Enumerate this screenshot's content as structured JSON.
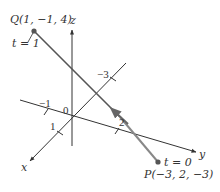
{
  "diagram": {
    "type": "3d-line-segment",
    "axes": {
      "x_label": "x",
      "y_label": "y",
      "z_label": "z",
      "origin_label": "0"
    },
    "ticks": {
      "x_pos": "1",
      "x_neg": "−3",
      "y_neg": "−1",
      "y_pos": "2"
    },
    "points": {
      "Q": {
        "label": "Q(1, −1, 4)",
        "param": "t = 1",
        "coords": [
          1,
          -1,
          4
        ]
      },
      "P": {
        "label": "P(−3, 2, −3)",
        "param": "t = 0",
        "coords": [
          -3,
          2,
          -3
        ]
      }
    },
    "colors": {
      "axis": "#333333",
      "segment": "#555555",
      "segment_highlight": "#8a8a8a",
      "point": "#555555"
    }
  }
}
